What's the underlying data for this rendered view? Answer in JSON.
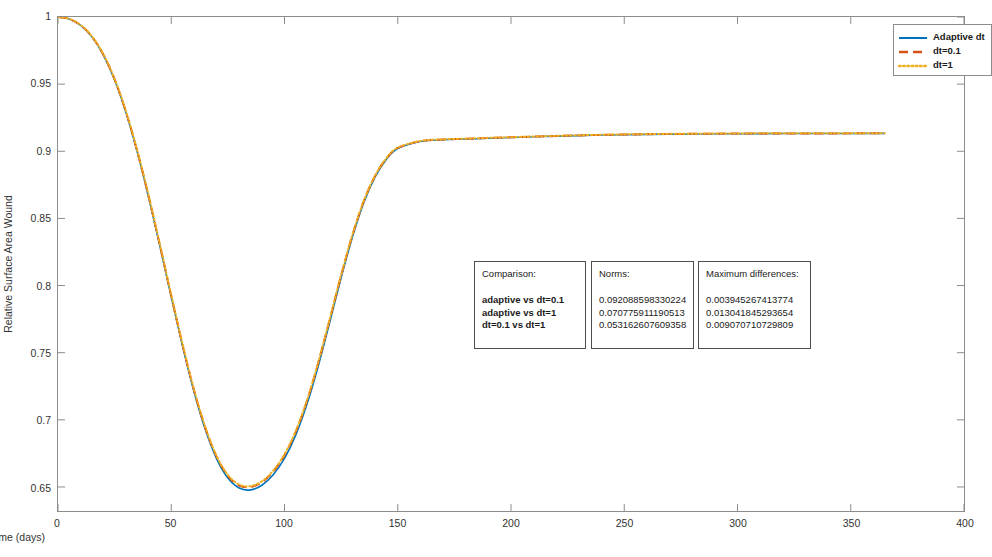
{
  "chart_data": {
    "type": "line",
    "title": "",
    "xlabel": "Time (days)",
    "ylabel": "Relative Surface Area Wound",
    "xlim": [
      0,
      400
    ],
    "ylim": [
      0.6321,
      1.0
    ],
    "xticks": [
      0,
      50,
      100,
      150,
      200,
      250,
      300,
      350,
      400
    ],
    "yticks": [
      0.65,
      0.7,
      0.75,
      0.8,
      0.85,
      0.9,
      0.95,
      1
    ],
    "ytick_labels": [
      "0.65",
      "0.7",
      "0.75",
      "0.8",
      "0.85",
      "0.9",
      "0.95",
      "1"
    ],
    "xtick_labels": [
      "0",
      "50",
      "100",
      "150",
      "200",
      "250",
      "300",
      "350",
      "400"
    ],
    "grid": false,
    "legend_position": "top-right",
    "series": [
      {
        "name": "Adaptive dt",
        "color": "#0072BD",
        "style": "solid",
        "x": [
          0,
          5,
          10,
          15,
          20,
          25,
          30,
          35,
          40,
          45,
          50,
          55,
          60,
          65,
          70,
          75,
          80,
          85,
          90,
          95,
          100,
          105,
          110,
          115,
          120,
          125,
          130,
          135,
          140,
          145,
          150,
          160,
          170,
          180,
          190,
          200,
          220,
          240,
          260,
          280,
          300,
          320,
          340,
          365
        ],
        "y": [
          1.0,
          0.9985,
          0.9938,
          0.9852,
          0.9718,
          0.9531,
          0.9289,
          0.8995,
          0.8658,
          0.8292,
          0.7915,
          0.7548,
          0.7213,
          0.6929,
          0.6711,
          0.6566,
          0.6492,
          0.6478,
          0.6513,
          0.6591,
          0.6713,
          0.6888,
          0.7121,
          0.7407,
          0.7729,
          0.8058,
          0.8362,
          0.8617,
          0.8809,
          0.8941,
          0.9021,
          0.9073,
          0.9086,
          0.9091,
          0.9097,
          0.9103,
          0.9113,
          0.9121,
          0.9126,
          0.9129,
          0.9131,
          0.9132,
          0.9132,
          0.9133
        ]
      },
      {
        "name": "dt=0.1",
        "color": "#D95319",
        "style": "dashed",
        "x": [
          0,
          5,
          10,
          15,
          20,
          25,
          30,
          35,
          40,
          45,
          50,
          55,
          60,
          65,
          70,
          75,
          80,
          85,
          90,
          95,
          100,
          105,
          110,
          115,
          120,
          125,
          130,
          135,
          140,
          145,
          150,
          160,
          170,
          180,
          190,
          200,
          220,
          240,
          260,
          280,
          300,
          320,
          340,
          365
        ],
        "y": [
          1.0,
          0.9985,
          0.9939,
          0.9854,
          0.9721,
          0.9535,
          0.9294,
          0.9001,
          0.8665,
          0.83,
          0.7924,
          0.7558,
          0.7224,
          0.6942,
          0.6726,
          0.6583,
          0.6511,
          0.6499,
          0.6535,
          0.6614,
          0.6737,
          0.6912,
          0.7145,
          0.743,
          0.7749,
          0.8075,
          0.8376,
          0.8628,
          0.8817,
          0.8947,
          0.9025,
          0.9075,
          0.9088,
          0.9093,
          0.9099,
          0.9104,
          0.9114,
          0.9122,
          0.9127,
          0.913,
          0.9132,
          0.9133,
          0.9133,
          0.9134
        ]
      },
      {
        "name": "dt=1",
        "color": "#EDB120",
        "style": "dotted",
        "x": [
          0,
          5,
          10,
          15,
          20,
          25,
          30,
          35,
          40,
          45,
          50,
          55,
          60,
          65,
          70,
          75,
          80,
          85,
          90,
          95,
          100,
          105,
          110,
          115,
          120,
          125,
          130,
          135,
          140,
          145,
          150,
          160,
          170,
          180,
          190,
          200,
          220,
          240,
          260,
          280,
          300,
          320,
          340,
          365
        ],
        "y": [
          1.0,
          0.9986,
          0.994,
          0.9856,
          0.9724,
          0.9539,
          0.9299,
          0.9006,
          0.8671,
          0.8306,
          0.793,
          0.7564,
          0.723,
          0.6948,
          0.6732,
          0.659,
          0.6518,
          0.6506,
          0.6542,
          0.6621,
          0.6744,
          0.6919,
          0.7151,
          0.7436,
          0.7754,
          0.8079,
          0.838,
          0.8631,
          0.8819,
          0.8949,
          0.9027,
          0.9076,
          0.9089,
          0.9094,
          0.91,
          0.9105,
          0.9115,
          0.9123,
          0.9128,
          0.9131,
          0.9133,
          0.9134,
          0.9134,
          0.9135
        ]
      }
    ]
  },
  "legend": {
    "entries": [
      {
        "label": "Adaptive dt"
      },
      {
        "label": "dt=0.1"
      },
      {
        "label": "dt=1"
      }
    ]
  },
  "annotations": {
    "comparison": {
      "header": "Comparison:",
      "rows": [
        "adaptive vs dt=0.1",
        "adaptive vs dt=1",
        "dt=0.1 vs dt=1"
      ]
    },
    "norms": {
      "header": "Norms:",
      "rows": [
        "0.092088598330224",
        "0.070775911190513",
        "0.053162607609358"
      ]
    },
    "maximum_differences": {
      "header": "Maximum differences:",
      "rows": [
        "0.003945267413774",
        "0.013041845293654",
        "0.009070710729809"
      ]
    }
  }
}
